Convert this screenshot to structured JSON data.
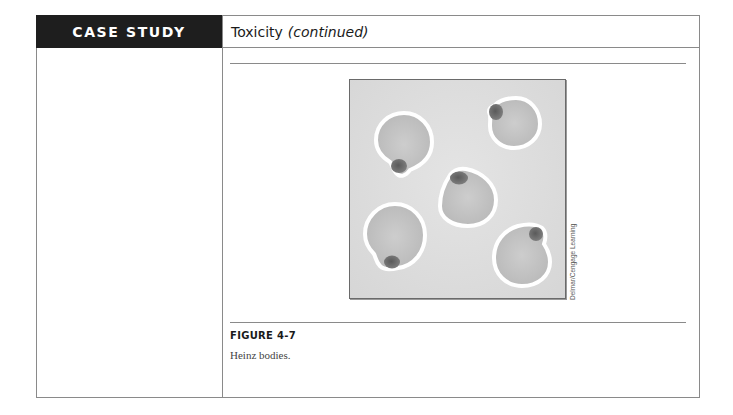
{
  "header": {
    "section_label": "CASE STUDY",
    "title": "Toxicity",
    "title_suffix": "(continued)"
  },
  "figure": {
    "number": "FIGURE 4-7",
    "caption": "Heinz bodies.",
    "credit": "Delmar/Cengage Learning",
    "colors": {
      "background": "#dcdcdc",
      "cell_fill": "#c4c4c4",
      "cell_halo": "#ffffff",
      "inclusion": "#6f6f6f"
    }
  }
}
